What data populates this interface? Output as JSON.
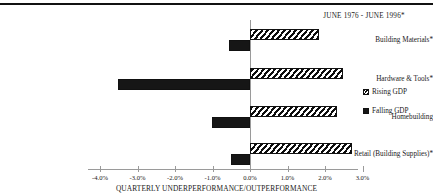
{
  "chart_data": {
    "type": "bar",
    "orientation": "horizontal",
    "title": "JUNE 1976 - JUNE 1996*",
    "xlabel": "QUARTERLY UNDERPERFORMANCE/OUTPERFORMANCE",
    "ylabel": "",
    "categories": [
      "Building Materials*",
      "Hardware & Tools*",
      "Homebuilding",
      "Retail (Building Supplies)*"
    ],
    "series": [
      {
        "name": "Rising GDP",
        "values": [
          1.84,
          2.48,
          2.32,
          2.72
        ]
      },
      {
        "name": "Falling GDP",
        "values": [
          -0.56,
          -3.52,
          -1.01,
          -0.5
        ]
      }
    ],
    "xlim": [
      -4.0,
      3.0
    ],
    "xticks": [
      -4.0,
      -3.0,
      -2.0,
      -1.0,
      0.0,
      1.0,
      2.0,
      3.0
    ],
    "xtick_labels": [
      "-4.0%",
      "-3.0%",
      "-2.0%",
      "-1.0%",
      "0.0%",
      "1.0%",
      "2.0%",
      "3.0%"
    ],
    "grid": false,
    "legend_position": "right",
    "colors": {
      "rising_gdp": "#0d0d0d",
      "falling_gdp": "#161616",
      "axis": "#9a9a9a",
      "text": "#1a1a1a",
      "background": "#ffffff"
    }
  },
  "legend": {
    "items": [
      {
        "label": "Rising GDP",
        "pattern": "diagonal-hatch"
      },
      {
        "label": "Falling GDP",
        "pattern": "solid"
      }
    ]
  }
}
